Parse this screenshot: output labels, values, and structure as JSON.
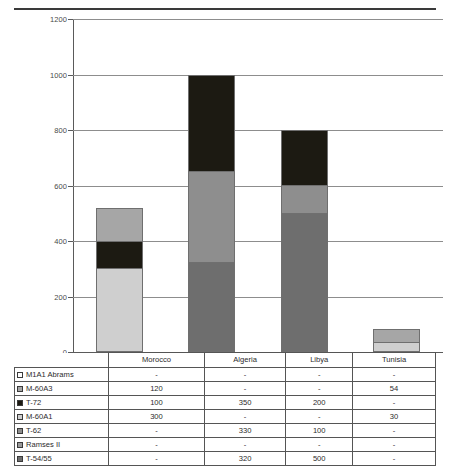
{
  "chart_data": {
    "type": "bar",
    "subtype": "stacked",
    "title": "",
    "xlabel": "",
    "ylabel": "",
    "ylim": [
      0,
      1200
    ],
    "ytick_step": 200,
    "yticks": [
      0,
      200,
      400,
      600,
      800,
      1000,
      1200
    ],
    "grid": true,
    "legend_position": "table-below",
    "categories": [
      "Morocco",
      "Algeria",
      "Libya",
      "Tunisia"
    ],
    "series": [
      {
        "name": "M1A1 Abrams",
        "color": "#ffffff",
        "values": [
          null,
          null,
          null,
          null
        ],
        "display": [
          "-",
          "-",
          "-",
          "-"
        ]
      },
      {
        "name": "M-60A3",
        "color": "#a6a6a6",
        "values": [
          120,
          null,
          null,
          54
        ],
        "display": [
          "120",
          "-",
          "-",
          "54"
        ]
      },
      {
        "name": "T-72",
        "color": "#1c1a12",
        "values": [
          100,
          350,
          200,
          null
        ],
        "display": [
          "100",
          "350",
          "200",
          "-"
        ]
      },
      {
        "name": "M-60A1",
        "color": "#cfcfcf",
        "values": [
          300,
          null,
          null,
          30
        ],
        "display": [
          "300",
          "-",
          "-",
          "30"
        ]
      },
      {
        "name": "T-62",
        "color": "#8e8e8e",
        "values": [
          null,
          330,
          100,
          null
        ],
        "display": [
          "-",
          "330",
          "100",
          "-"
        ]
      },
      {
        "name": "Ramses II",
        "color": "#9a9a9a",
        "values": [
          null,
          null,
          null,
          null
        ],
        "display": [
          "-",
          "-",
          "-",
          "-"
        ]
      },
      {
        "name": "T-54/55",
        "color": "#6e6e6e",
        "values": [
          null,
          320,
          500,
          null
        ],
        "display": [
          "-",
          "320",
          "500",
          "-"
        ]
      }
    ],
    "totals": [
      520,
      1000,
      800,
      84
    ],
    "stack_order_bottom_to_top": [
      "T-54/55",
      "Ramses II",
      "T-62",
      "M-60A1",
      "T-72",
      "M-60A3",
      "M1A1 Abrams"
    ],
    "bars": [
      {
        "category": "Morocco",
        "segments": [
          {
            "series": "M-60A1",
            "value": 300,
            "color": "#cfcfcf"
          },
          {
            "series": "T-72",
            "value": 100,
            "color": "#1c1a12"
          },
          {
            "series": "M-60A3",
            "value": 120,
            "color": "#a6a6a6"
          }
        ]
      },
      {
        "category": "Algeria",
        "segments": [
          {
            "series": "T-54/55",
            "value": 320,
            "color": "#6e6e6e"
          },
          {
            "series": "T-62",
            "value": 330,
            "color": "#8e8e8e"
          },
          {
            "series": "T-72",
            "value": 350,
            "color": "#1c1a12"
          }
        ]
      },
      {
        "category": "Libya",
        "segments": [
          {
            "series": "T-54/55",
            "value": 500,
            "color": "#6e6e6e"
          },
          {
            "series": "T-62",
            "value": 100,
            "color": "#8e8e8e"
          },
          {
            "series": "T-72",
            "value": 200,
            "color": "#1c1a12"
          }
        ]
      },
      {
        "category": "Tunisia",
        "segments": [
          {
            "series": "M-60A1",
            "value": 30,
            "color": "#cfcfcf"
          },
          {
            "series": "M-60A3",
            "value": 54,
            "color": "#a6a6a6"
          }
        ]
      }
    ]
  },
  "table": {
    "corner_label": "",
    "columns": [
      "Morocco",
      "Algeria",
      "Libya",
      "Tunisia"
    ],
    "rows": [
      {
        "label": "M1A1 Abrams",
        "swatch": "#ffffff",
        "values": [
          "-",
          "-",
          "-",
          "-"
        ]
      },
      {
        "label": "M-60A3",
        "swatch": "#a6a6a6",
        "values": [
          "120",
          "-",
          "-",
          "54"
        ]
      },
      {
        "label": "T-72",
        "swatch": "#1c1a12",
        "values": [
          "100",
          "350",
          "200",
          "-"
        ]
      },
      {
        "label": "M-60A1",
        "swatch": "#cfcfcf",
        "values": [
          "300",
          "-",
          "-",
          "30"
        ]
      },
      {
        "label": "T-62",
        "swatch": "#8e8e8e",
        "values": [
          "-",
          "330",
          "100",
          "-"
        ]
      },
      {
        "label": "Ramses II",
        "swatch": "#9a9a9a",
        "values": [
          "-",
          "-",
          "-",
          "-"
        ]
      },
      {
        "label": "T-54/55",
        "swatch": "#6e6e6e",
        "values": [
          "-",
          "320",
          "500",
          "-"
        ]
      }
    ]
  },
  "footnote": ""
}
